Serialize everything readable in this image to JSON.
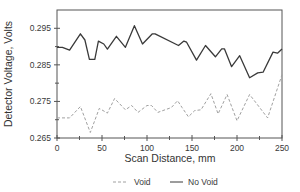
{
  "chart_data": {
    "type": "line",
    "title": "",
    "xlabel": "Scan Distance, mm",
    "ylabel": "Detector Voltage, Volts",
    "xlim": [
      0,
      250
    ],
    "ylim": [
      0.265,
      0.3
    ],
    "xticks": [
      0,
      50,
      100,
      150,
      200,
      250
    ],
    "xminor_ticks": [
      25,
      75,
      125,
      175,
      225
    ],
    "yticks": [
      0.265,
      0.275,
      0.285,
      0.295
    ],
    "ytick_labels": [
      "0.265",
      "0.275",
      "0.285",
      "0.295"
    ],
    "xtick_labels": [
      "0",
      "50",
      "100",
      "150",
      "200",
      "250"
    ],
    "grid": false,
    "legend_position": "bottom",
    "series": [
      {
        "name": "Void",
        "style": "dashed",
        "color": "#a0a0a0",
        "x": [
          0,
          14,
          26,
          37,
          47,
          56,
          64,
          76,
          83,
          90,
          100,
          105,
          112,
          120,
          127,
          134,
          139,
          146,
          153,
          160,
          171,
          179,
          189,
          200,
          214,
          234,
          250
        ],
        "values": [
          0.2705,
          0.2705,
          0.2736,
          0.2665,
          0.2731,
          0.2718,
          0.2758,
          0.2727,
          0.2739,
          0.272,
          0.2739,
          0.2739,
          0.272,
          0.2727,
          0.2733,
          0.2752,
          0.2733,
          0.2708,
          0.2725,
          0.2727,
          0.2771,
          0.2716,
          0.2769,
          0.2697,
          0.2769,
          0.2705,
          0.2823
        ]
      },
      {
        "name": "No Void",
        "style": "solid",
        "color": "#3a3a3a",
        "x": [
          0,
          6,
          14,
          26,
          31,
          36,
          42,
          46,
          52,
          56,
          66,
          76,
          86,
          95,
          106,
          109,
          135,
          141,
          144,
          155,
          165,
          176,
          183,
          186,
          194,
          203,
          214,
          223,
          229,
          240,
          245,
          250
        ],
        "values": [
          0.2898,
          0.2898,
          0.289,
          0.2935,
          0.2918,
          0.2865,
          0.2865,
          0.2915,
          0.2907,
          0.2893,
          0.2928,
          0.2898,
          0.2957,
          0.2907,
          0.2935,
          0.2935,
          0.2903,
          0.2915,
          0.2912,
          0.2863,
          0.2903,
          0.2872,
          0.2894,
          0.2894,
          0.2845,
          0.2875,
          0.2815,
          0.2828,
          0.283,
          0.2885,
          0.2882,
          0.2893
        ]
      }
    ]
  },
  "legend": {
    "items": [
      {
        "label": "Void",
        "style": "dashed"
      },
      {
        "label": "No Void",
        "style": "solid"
      }
    ]
  }
}
